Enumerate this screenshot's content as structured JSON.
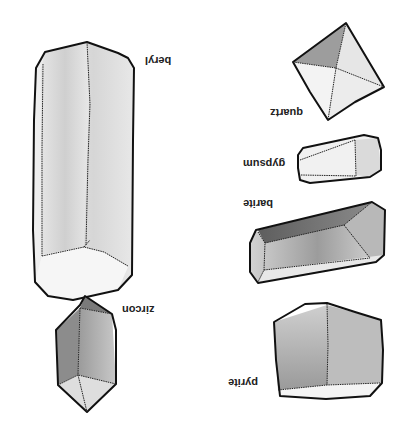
{
  "orientation": "rotated-180",
  "background": "#ffffff",
  "crystals": [
    {
      "name": "beryl",
      "label": "beryl"
    },
    {
      "name": "quartz",
      "label": "quartz"
    },
    {
      "name": "gypsum",
      "label": "gypsum"
    },
    {
      "name": "barite",
      "label": "barite"
    },
    {
      "name": "zircon",
      "label": "zircon"
    },
    {
      "name": "pyrite",
      "label": "pyrite"
    }
  ],
  "colors": {
    "outline": "#111111",
    "shade_dark": "#6e6e6e",
    "shade_mid": "#a8a8a8",
    "shade_light": "#dcdcdc",
    "face_white": "#f4f4f4"
  }
}
